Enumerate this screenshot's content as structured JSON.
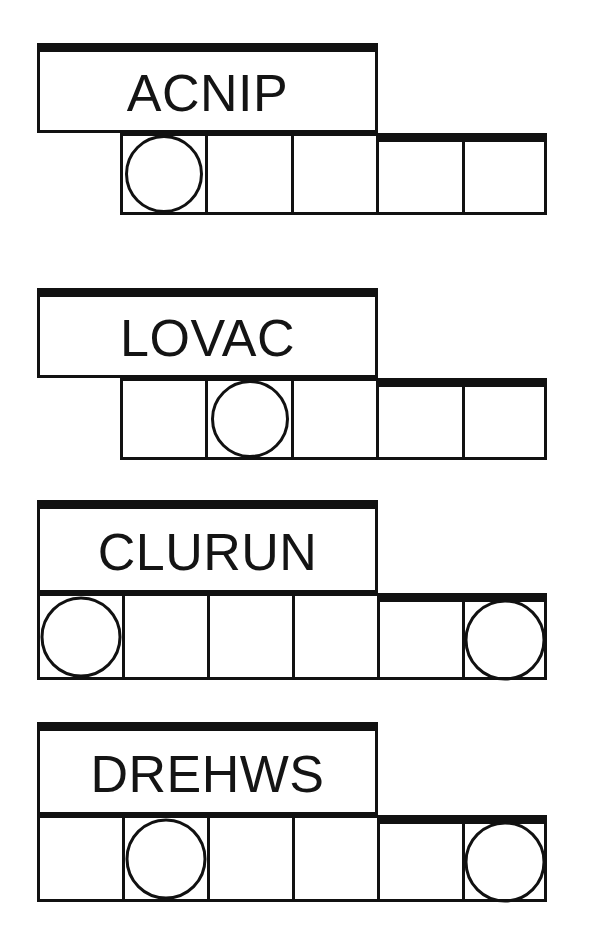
{
  "page": {
    "background_color": "#ffffff",
    "ink_color": "#111111",
    "width": 593,
    "height": 931
  },
  "puzzle": {
    "type": "word-unscramble-worksheet",
    "row_count": 4,
    "rows": [
      {
        "id": "row-1",
        "scrambled_word": "ACNIP",
        "letter_count": 5,
        "cell_count": 5,
        "circled_cells": [
          1
        ],
        "word_box": {
          "x": 37,
          "y": 43,
          "width": 341,
          "height": 90
        },
        "cell_strip": {
          "x": 120,
          "y": 133,
          "cell_width": 85,
          "cell_height": 82
        }
      },
      {
        "id": "row-2",
        "scrambled_word": "LOVAC",
        "letter_count": 5,
        "cell_count": 5,
        "circled_cells": [
          2
        ],
        "word_box": {
          "x": 37,
          "y": 288,
          "width": 341,
          "height": 90
        },
        "cell_strip": {
          "x": 120,
          "y": 378,
          "cell_width": 85,
          "cell_height": 82
        }
      },
      {
        "id": "row-3",
        "scrambled_word": "CLURUN",
        "letter_count": 6,
        "cell_count": 6,
        "circled_cells": [
          1,
          6
        ],
        "word_box": {
          "x": 37,
          "y": 500,
          "width": 341,
          "height": 93
        },
        "cell_strip": {
          "x": 37,
          "y": 593,
          "cell_width": 85,
          "cell_height": 87
        }
      },
      {
        "id": "row-4",
        "scrambled_word": "DREHWS",
        "letter_count": 6,
        "cell_count": 6,
        "circled_cells": [
          2,
          6
        ],
        "word_box": {
          "x": 37,
          "y": 722,
          "width": 341,
          "height": 93
        },
        "cell_strip": {
          "x": 37,
          "y": 815,
          "cell_width": 85,
          "cell_height": 87
        }
      }
    ]
  }
}
